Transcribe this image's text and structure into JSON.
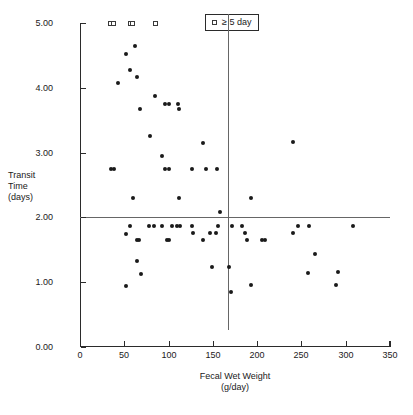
{
  "chart_data": {
    "type": "scatter",
    "title": "",
    "xlabel": "Fecal Wet Weight",
    "xlabel_units": "(g/day)",
    "ylabel_lines": [
      "Transit",
      "Time",
      "(days)"
    ],
    "xlim": [
      0,
      350
    ],
    "ylim": [
      0,
      5
    ],
    "xticks": [
      0,
      50,
      100,
      150,
      200,
      250,
      300,
      350
    ],
    "xtick_labels": [
      "0",
      "50",
      "100",
      "150",
      "200",
      "250",
      "300",
      "350"
    ],
    "yticks": [
      0,
      1,
      2,
      3,
      4,
      5
    ],
    "ytick_labels": [
      "0.00",
      "1.00",
      "2.00",
      "3.00",
      "4.00",
      "5.00"
    ],
    "grid": false,
    "legend_position": "top-center",
    "reference_lines": {
      "horizontal_y": 2.0,
      "vertical_x": 167
    },
    "legend": [
      {
        "marker": "open-square",
        "label": "≥ 5 day"
      }
    ],
    "series": [
      {
        "name": "transit time",
        "marker": "filled-circle",
        "color": "#1a1a1a",
        "points": [
          [
            43,
            4.07
          ],
          [
            52,
            4.52
          ],
          [
            57,
            4.28
          ],
          [
            62,
            4.64
          ],
          [
            64,
            4.17
          ],
          [
            68,
            3.67
          ],
          [
            79,
            3.25
          ],
          [
            85,
            3.87
          ],
          [
            93,
            2.95
          ],
          [
            96,
            3.75
          ],
          [
            101,
            3.75
          ],
          [
            111,
            3.75
          ],
          [
            112,
            3.67
          ],
          [
            139,
            3.15
          ],
          [
            241,
            3.16
          ],
          [
            35,
            2.74
          ],
          [
            38,
            2.74
          ],
          [
            96,
            2.74
          ],
          [
            100,
            2.74
          ],
          [
            127,
            2.74
          ],
          [
            142,
            2.74
          ],
          [
            155,
            2.74
          ],
          [
            60,
            2.3
          ],
          [
            112,
            2.3
          ],
          [
            193,
            2.3
          ],
          [
            158,
            2.08
          ],
          [
            52,
            1.75
          ],
          [
            57,
            1.86
          ],
          [
            64,
            1.65
          ],
          [
            67,
            1.65
          ],
          [
            78,
            1.86
          ],
          [
            83,
            1.86
          ],
          [
            93,
            1.86
          ],
          [
            98,
            1.65
          ],
          [
            101,
            1.65
          ],
          [
            104,
            1.86
          ],
          [
            109,
            1.86
          ],
          [
            113,
            1.86
          ],
          [
            126,
            1.86
          ],
          [
            128,
            1.76
          ],
          [
            139,
            1.65
          ],
          [
            147,
            1.76
          ],
          [
            153,
            1.76
          ],
          [
            156,
            1.86
          ],
          [
            172,
            1.86
          ],
          [
            183,
            1.86
          ],
          [
            186,
            1.76
          ],
          [
            188,
            1.65
          ],
          [
            205,
            1.65
          ],
          [
            209,
            1.65
          ],
          [
            240,
            1.76
          ],
          [
            246,
            1.86
          ],
          [
            259,
            1.87
          ],
          [
            308,
            1.86
          ],
          [
            64,
            1.32
          ],
          [
            69,
            1.13
          ],
          [
            149,
            1.24
          ],
          [
            168,
            1.23
          ],
          [
            265,
            1.44
          ],
          [
            257,
            1.14
          ],
          [
            291,
            1.15
          ],
          [
            52,
            0.94
          ],
          [
            170,
            0.85
          ],
          [
            193,
            0.95
          ],
          [
            289,
            0.96
          ]
        ]
      },
      {
        "name": "≥ 5 day",
        "marker": "open-square",
        "color": "#3a3a3a",
        "points": [
          [
            34,
            5.0
          ],
          [
            38,
            5.0
          ],
          [
            57,
            5.0
          ],
          [
            59,
            5.0
          ],
          [
            85,
            5.0
          ]
        ]
      }
    ]
  }
}
